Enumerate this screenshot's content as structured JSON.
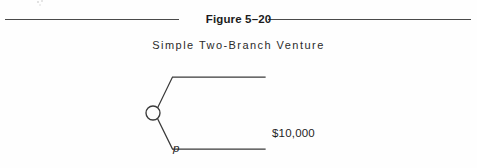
{
  "figure": {
    "title": "Figure 5–20",
    "subtitle": "Simple Two-Branch Venture"
  },
  "colors": {
    "ink": "#1e1e1e",
    "rule": "#4a4a4a",
    "line": "#3a3a3a",
    "background": "#fefefe"
  },
  "diagram": {
    "type": "decision-tree",
    "node": {
      "kind": "chance-node",
      "shape": "circle",
      "center_x": 153,
      "center_y": 113,
      "radius": 7
    },
    "branches": [
      {
        "id": "upper",
        "probability_label": "p",
        "payoff_label": "$10,000",
        "payoff_value": 10000,
        "direction": "up"
      },
      {
        "id": "lower",
        "probability_label": "1 – p",
        "payoff_label": "$0",
        "payoff_value": 0,
        "direction": "down"
      }
    ]
  }
}
